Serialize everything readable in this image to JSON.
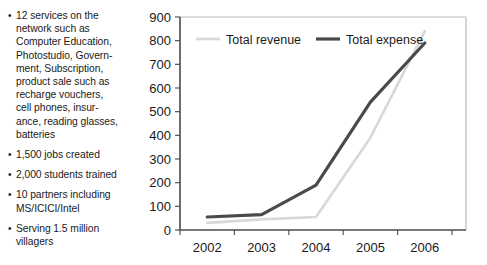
{
  "bullets": [
    {
      "id": "services",
      "text": "12 services on the\nnetwork such as\nComputer Education,\nPhotostudio, Govern-\nment, Subscription,\nproduct sale such as\nrecharge vouchers,\ncell phones, insur-\nance, reading glasses,\nbatteries"
    },
    {
      "id": "jobs",
      "text": "1,500 jobs created"
    },
    {
      "id": "students",
      "text": "2,000 students trained"
    },
    {
      "id": "partners",
      "text": "10 partners including\nMS/ICICI/Intel"
    },
    {
      "id": "villagers",
      "text": "Serving 1.5 million\nvillagers"
    }
  ],
  "bullet_marker": "•",
  "chart_data": {
    "type": "line",
    "title": "",
    "xlabel": "",
    "ylabel": "",
    "categories": [
      "2002",
      "2003",
      "2004",
      "2005",
      "2006"
    ],
    "x_tick_labels": [
      "2002",
      "2003",
      "2004",
      "2005",
      "2006"
    ],
    "y_tick_labels": [
      "0",
      "100",
      "200",
      "300",
      "400",
      "500",
      "600",
      "700",
      "800",
      "900"
    ],
    "y_tick_values": [
      0,
      100,
      200,
      300,
      400,
      500,
      600,
      700,
      800,
      900
    ],
    "ylim": [
      0,
      900
    ],
    "grid": false,
    "legend_position": "top-inside",
    "series": [
      {
        "name": "Total revenue",
        "color": "#d8d8d8",
        "width": 2.6,
        "values": [
          30,
          45,
          55,
          390,
          840
        ]
      },
      {
        "name": "Total expense",
        "color": "#4a4a4a",
        "width": 3.2,
        "values": [
          55,
          65,
          190,
          540,
          790
        ]
      }
    ]
  }
}
